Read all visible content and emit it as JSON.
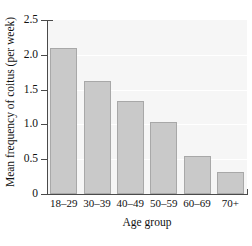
{
  "chart_data": {
    "type": "bar",
    "title": "",
    "xlabel": "Age group",
    "ylabel": "Mean frequency of coitus (per week)",
    "categories": [
      "18–29",
      "30–39",
      "40–49",
      "50–59",
      "60–69",
      "70+"
    ],
    "values": [
      2.1,
      1.62,
      1.33,
      1.04,
      0.54,
      0.32
    ],
    "ylim": [
      0,
      2.5
    ],
    "yticks": [
      "0",
      "0.5",
      "1.0",
      "1.5",
      "2.0",
      "2.5"
    ],
    "ytick_values": [
      0,
      0.5,
      1.0,
      1.5,
      2.0,
      2.5
    ],
    "grid": true,
    "legend": false,
    "bar_color": "#c9c9c9",
    "bar_edge_color": "#a8a8a8",
    "plot_background": "#f6f6f6",
    "gridline_color": "#ffffff",
    "axis_color": "#4a4a4a"
  }
}
